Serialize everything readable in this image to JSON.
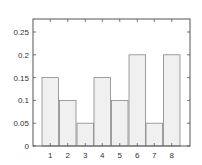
{
  "chart_data": {
    "type": "bar",
    "title": "",
    "xlabel": "",
    "ylabel": "",
    "categories": [
      "1",
      "2",
      "3",
      "4",
      "5",
      "6",
      "7",
      "8"
    ],
    "values": [
      0.15,
      0.1,
      0.05,
      0.15,
      0.1,
      0.2,
      0.05,
      0.2
    ],
    "ylim": [
      0,
      0.28
    ],
    "yticks": [
      0,
      0.05,
      0.1,
      0.15,
      0.2,
      0.25
    ],
    "ytick_labels": [
      "0",
      "0.05",
      "0.1",
      "0.15",
      "0.2",
      "0.25"
    ],
    "grid": false,
    "legend": null,
    "bar_fill": "#f0f0f0",
    "bar_stroke": "#888888",
    "axis_color": "#555555"
  }
}
